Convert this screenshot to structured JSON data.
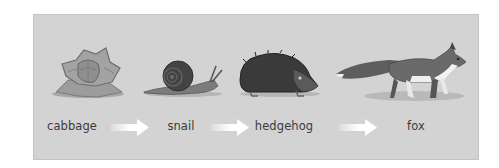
{
  "diagram": {
    "type": "food-chain",
    "background_color": "#d3d3d3",
    "arrow_color": "#ffffff",
    "nodes": [
      {
        "id": "cabbage",
        "label": "cabbage",
        "icon": "cabbage-icon"
      },
      {
        "id": "snail",
        "label": "snail",
        "icon": "snail-icon"
      },
      {
        "id": "hedgehog",
        "label": "hedgehog",
        "icon": "hedgehog-icon"
      },
      {
        "id": "fox",
        "label": "fox",
        "icon": "fox-icon"
      }
    ],
    "edges": [
      {
        "from": "cabbage",
        "to": "snail"
      },
      {
        "from": "snail",
        "to": "hedgehog"
      },
      {
        "from": "hedgehog",
        "to": "fox"
      }
    ]
  }
}
